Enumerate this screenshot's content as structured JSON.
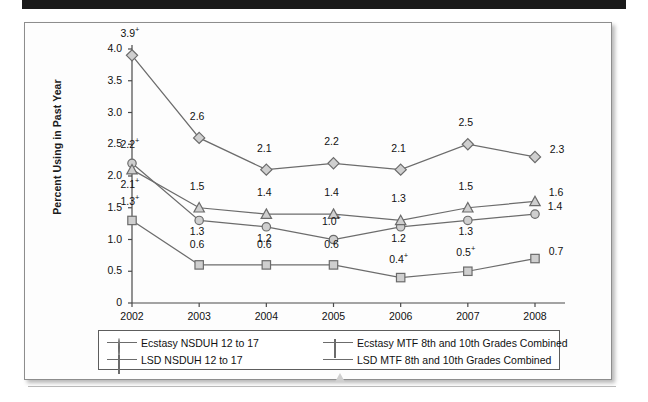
{
  "figure": {
    "caption": "",
    "y_axis_title": "Percent Using in Past Year"
  },
  "chart_data": {
    "type": "line",
    "title": "",
    "xlabel": "",
    "ylabel": "Percent Using in Past Year",
    "x": [
      "2002",
      "2003",
      "2004",
      "2005",
      "2006",
      "2007",
      "2008"
    ],
    "ylim": [
      0,
      4.0
    ],
    "ytick_labels": [
      "4.0",
      "3.5",
      "3.0",
      "2.5",
      "2.0",
      "1.5",
      "1.0",
      "0.5",
      "0"
    ],
    "ytick_values": [
      4.0,
      3.5,
      3.0,
      2.5,
      2.0,
      1.5,
      1.0,
      0.5,
      0
    ],
    "grid": false,
    "legend_position": "bottom",
    "series": [
      {
        "name": "Ecstasy NSDUH 12 to 17",
        "marker": "circle",
        "values": [
          2.2,
          1.3,
          1.2,
          1.0,
          1.2,
          1.3,
          1.4
        ],
        "labels": [
          "2.2+",
          "1.3",
          "1.2",
          "1.0+",
          "1.2",
          "1.3",
          "1.4"
        ]
      },
      {
        "name": "Ecstasy MTF 8th and 10th Grades Combined",
        "marker": "diamond",
        "values": [
          3.9,
          2.6,
          2.1,
          2.2,
          2.1,
          2.5,
          2.3
        ],
        "labels": [
          "3.9+",
          "2.6",
          "2.1",
          "2.2",
          "2.1",
          "2.5",
          "2.3"
        ]
      },
      {
        "name": "LSD NSDUH 12 to 17",
        "marker": "square",
        "values": [
          1.3,
          0.6,
          0.6,
          0.6,
          0.4,
          0.5,
          0.7
        ],
        "labels": [
          "1.3+",
          "0.6",
          "0.6",
          "0.6",
          "0.4+",
          "0.5+",
          "0.7"
        ]
      },
      {
        "name": "LSD MTF 8th and 10th Grades Combined",
        "marker": "triangle",
        "values": [
          2.1,
          1.5,
          1.4,
          1.4,
          1.3,
          1.5,
          1.6
        ],
        "labels": [
          "2.1+",
          "1.5",
          "1.4",
          "1.4",
          "1.3",
          "1.5",
          "1.6"
        ]
      }
    ],
    "colors": {
      "marker_fill": "#cfcfcf",
      "marker_stroke": "#6b6b6b",
      "line": "#6c6c6c",
      "axis": "#4a4a4a",
      "text": "#111111"
    }
  },
  "legend": {
    "entries": [
      {
        "label": "Ecstasy NSDUH 12 to 17",
        "marker": "circle"
      },
      {
        "label": "Ecstasy MTF 8th and 10th Grades Combined",
        "marker": "diamond"
      },
      {
        "label": "LSD NSDUH 12 to 17",
        "marker": "square"
      },
      {
        "label": "LSD MTF 8th and 10th Grades Combined",
        "marker": "triangle"
      }
    ]
  }
}
